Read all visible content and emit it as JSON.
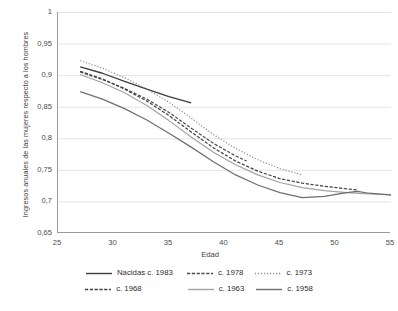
{
  "chart_data": {
    "type": "line",
    "title": "",
    "xlabel": "Edad",
    "ylabel": "Ingresos anuales de las mujeres respecto a los hombres",
    "xlim": [
      25,
      55
    ],
    "ylim": [
      0.65,
      1
    ],
    "xticks": [
      25,
      30,
      35,
      40,
      45,
      50,
      55
    ],
    "xtick_labels": [
      "25",
      "30",
      "35",
      "40",
      "45",
      "50",
      "55"
    ],
    "xminor_step": 1,
    "yticks": [
      0.65,
      0.7,
      0.75,
      0.8,
      0.85,
      0.9,
      0.95,
      1
    ],
    "ytick_labels": [
      "0,65",
      "0,7",
      "0,75",
      "0,8",
      "0,85",
      "0,9",
      "0,95",
      "1"
    ],
    "grid": "horizontal",
    "legend_position": "bottom",
    "series": [
      {
        "name": "Nacidas c. 1983",
        "style": "solid",
        "color": "#3d3d3d",
        "width": 1.3,
        "x": [
          27,
          29,
          31,
          33,
          35,
          37
        ],
        "y": [
          0.913,
          0.903,
          0.89,
          0.878,
          0.866,
          0.856
        ]
      },
      {
        "name": "c. 1978",
        "style": "dashed",
        "color": "#4a4a4a",
        "width": 1.2,
        "x": [
          27,
          29,
          31,
          33,
          35,
          37,
          39,
          41,
          42
        ],
        "y": [
          0.905,
          0.893,
          0.879,
          0.862,
          0.841,
          0.816,
          0.792,
          0.772,
          0.764
        ]
      },
      {
        "name": "c. 1973",
        "style": "dotted",
        "color": "#8d8d8d",
        "width": 1.2,
        "x": [
          27,
          29,
          31,
          33,
          35,
          37,
          39,
          41,
          43,
          45,
          47
        ],
        "y": [
          0.923,
          0.911,
          0.896,
          0.878,
          0.857,
          0.832,
          0.806,
          0.784,
          0.766,
          0.752,
          0.742
        ]
      },
      {
        "name": "c. 1968",
        "style": "dashed",
        "color": "#3f3f3f",
        "width": 1.2,
        "x": [
          27,
          29,
          31,
          33,
          35,
          37,
          39,
          41,
          43,
          45,
          47,
          49,
          51,
          52
        ],
        "y": [
          0.906,
          0.894,
          0.878,
          0.859,
          0.836,
          0.81,
          0.785,
          0.764,
          0.748,
          0.736,
          0.729,
          0.724,
          0.72,
          0.718
        ]
      },
      {
        "name": "c. 1963",
        "style": "solid",
        "color": "#a3a3a3",
        "width": 1.2,
        "x": [
          27,
          29,
          31,
          33,
          35,
          37,
          39,
          41,
          43,
          45,
          47,
          49,
          51,
          53,
          55
        ],
        "y": [
          0.901,
          0.888,
          0.872,
          0.852,
          0.828,
          0.802,
          0.778,
          0.758,
          0.742,
          0.73,
          0.722,
          0.717,
          0.714,
          0.712,
          0.711
        ]
      },
      {
        "name": "c. 1958",
        "style": "solid",
        "color": "#6e6e6e",
        "width": 1.2,
        "x": [
          27,
          29,
          31,
          33,
          35,
          37,
          39,
          41,
          43,
          45,
          47,
          49,
          51,
          52,
          53,
          55
        ],
        "y": [
          0.874,
          0.862,
          0.847,
          0.829,
          0.808,
          0.786,
          0.763,
          0.742,
          0.726,
          0.714,
          0.706,
          0.708,
          0.714,
          0.716,
          0.713,
          0.71
        ]
      }
    ],
    "legend": [
      {
        "label": "Nacidas c. 1983",
        "style": "solid",
        "color": "#3d3d3d"
      },
      {
        "label": "c. 1978",
        "style": "dashed",
        "color": "#4a4a4a"
      },
      {
        "label": "c. 1973",
        "style": "dotted",
        "color": "#8d8d8d"
      },
      {
        "label": "c. 1968",
        "style": "dashed",
        "color": "#3f3f3f"
      },
      {
        "label": "c. 1963",
        "style": "solid",
        "color": "#a3a3a3"
      },
      {
        "label": "c. 1958",
        "style": "solid",
        "color": "#6e6e6e"
      }
    ]
  },
  "colors": {
    "grid": "#e4e4e4",
    "axis": "#9a9a9a",
    "text": "#3c3c3c",
    "background": "#ffffff"
  }
}
